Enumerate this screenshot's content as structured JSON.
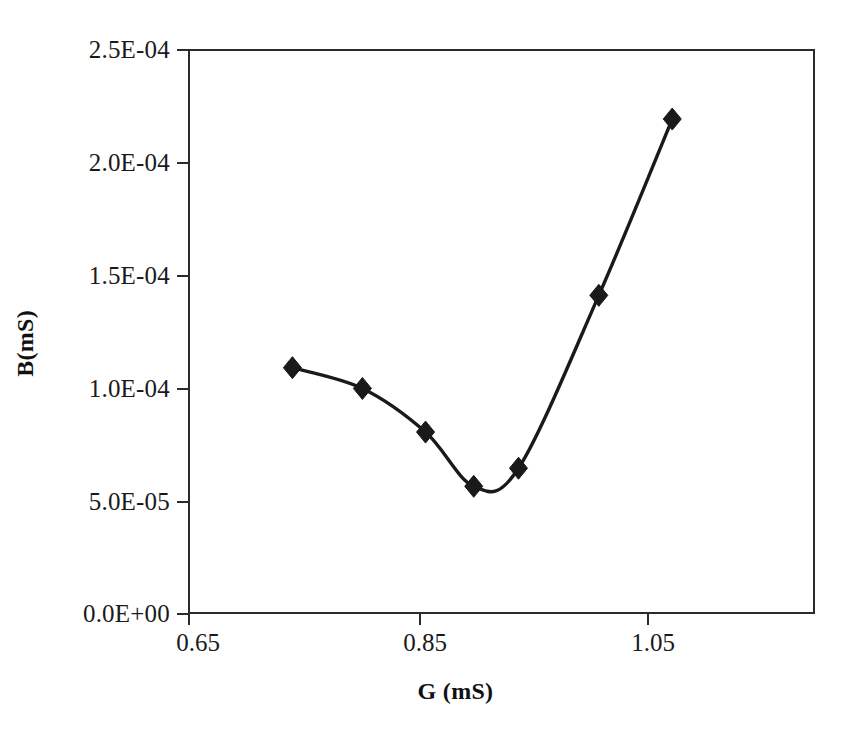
{
  "chart_data": {
    "type": "line",
    "title": "",
    "xlabel": "G (mS)",
    "ylabel": "B(mS)",
    "xlim": [
      0.65,
      1.1
    ],
    "ylim": [
      0.0,
      0.00025
    ],
    "grid": false,
    "legend": null,
    "marker": "diamond",
    "marker_color": "#1a1a1a",
    "line_color": "#1a1a1a",
    "xticks": [
      0.65,
      0.85,
      1.05
    ],
    "xtick_labels": [
      "0.65",
      "0.85",
      "1.05"
    ],
    "yticks": [
      0.0,
      5e-05,
      0.0001,
      0.00015,
      0.0002,
      0.00025
    ],
    "ytick_labels": [
      "0.0E+00",
      "5.0E-05",
      "1.0E-04",
      "1.5E-04",
      "2.0E-04",
      "2.5E-04"
    ],
    "x": [
      0.741,
      0.802,
      0.857,
      0.899,
      0.938,
      1.008,
      1.072
    ],
    "y": [
      0.000109,
      9.98e-05,
      8.05e-05,
      5.65e-05,
      6.45e-05,
      0.000141,
      0.000219
    ],
    "series": [
      {
        "name": "B(mS)",
        "x": [
          0.741,
          0.802,
          0.857,
          0.899,
          0.938,
          1.008,
          1.072
        ],
        "values": [
          0.000109,
          9.98e-05,
          8.05e-05,
          5.65e-05,
          6.45e-05,
          0.000141,
          0.000219
        ]
      }
    ],
    "points": [
      {
        "x": 0.741,
        "y": 0.000109
      },
      {
        "x": 0.802,
        "y": 9.98e-05
      },
      {
        "x": 0.857,
        "y": 8.05e-05
      },
      {
        "x": 0.899,
        "y": 5.65e-05
      },
      {
        "x": 0.938,
        "y": 6.45e-05
      },
      {
        "x": 1.008,
        "y": 0.000141
      },
      {
        "x": 1.072,
        "y": 0.000219
      }
    ]
  },
  "axes": {
    "y_title": "B(mS)",
    "x_title": "G (mS)",
    "y_labels": [
      "2.5E-04",
      "2.0E-04",
      "1.5E-04",
      "1.0E-04",
      "5.0E-05",
      "0.0E+00"
    ],
    "x_labels": [
      "0.65",
      "0.85",
      "1.05"
    ]
  },
  "style": {
    "background": "#ffffff",
    "axis_color": "#2b2b2b",
    "text_color": "#1a1a1a",
    "series_color": "#1a1a1a"
  }
}
